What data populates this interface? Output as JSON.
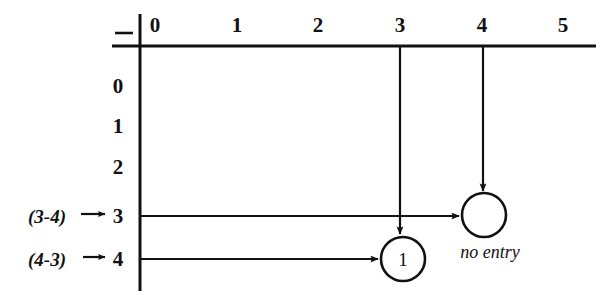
{
  "figure": {
    "kind": "matrix-grid-diagram",
    "corner_mark": "–",
    "ink_color": "#111111",
    "background_color": "#ffffff"
  },
  "columns": {
    "axis_name": "column-index-axis",
    "headers": [
      {
        "label": "0",
        "x": 155
      },
      {
        "label": "1",
        "x": 237
      },
      {
        "label": "2",
        "x": 318
      },
      {
        "label": "3",
        "x": 400
      },
      {
        "label": "4",
        "x": 482
      },
      {
        "label": "5",
        "x": 563
      }
    ]
  },
  "rows": {
    "axis_name": "row-index-axis",
    "headers": [
      {
        "label": "0",
        "y": 86
      },
      {
        "label": "1",
        "y": 126
      },
      {
        "label": "2",
        "y": 167
      },
      {
        "label": "3",
        "y": 216
      },
      {
        "label": "4",
        "y": 259
      }
    ]
  },
  "side_annotations": [
    {
      "text": "(3-4)",
      "target_row": "3",
      "x": 28,
      "y": 216
    },
    {
      "text": "(4-3)",
      "target_row": "4",
      "x": 28,
      "y": 259
    }
  ],
  "cells": [
    {
      "name": "cell-row4-col3",
      "value": "1",
      "row": "4",
      "column": "3",
      "cx": 403,
      "cy": 259,
      "r": 22,
      "filled": true
    },
    {
      "name": "cell-row3-col4",
      "value": "",
      "row": "3",
      "column": "4",
      "cx": 484,
      "cy": 215,
      "r": 22,
      "filled": false
    }
  ],
  "callouts": [
    {
      "text": "no entry",
      "x": 490,
      "y": 252,
      "refers_to": "cell-row3-col4"
    }
  ],
  "arrows": {
    "vertical": [
      {
        "name": "column-3-trace",
        "from_column": "3",
        "x": 400,
        "y1": 46,
        "y2": 234
      },
      {
        "name": "column-4-trace",
        "from_column": "4",
        "x": 483,
        "y1": 46,
        "y2": 191
      }
    ],
    "horizontal": [
      {
        "name": "row-3-trace",
        "from_row": "3",
        "y": 216,
        "x1": 141,
        "x2": 459
      },
      {
        "name": "row-4-trace",
        "from_row": "4",
        "y": 259,
        "x1": 141,
        "x2": 378
      }
    ]
  },
  "axes": {
    "horizontal_rule": {
      "y": 46,
      "x1": 112,
      "x2": 596
    },
    "vertical_rule": {
      "x": 140,
      "y1": 14,
      "y2": 291
    },
    "corner_dash": {
      "x1": 115,
      "x2": 133,
      "y": 33
    }
  }
}
